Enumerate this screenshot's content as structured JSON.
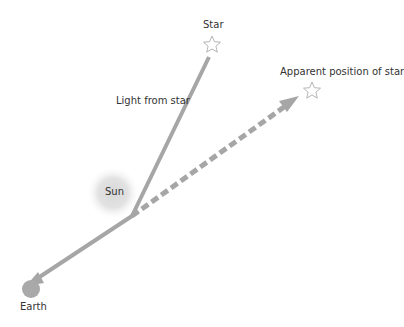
{
  "labels": {
    "star": "Star",
    "apparent": "Apparent position of star",
    "light": "Light from star",
    "sun": "Sun",
    "earth": "Earth"
  },
  "colors": {
    "ray": "#a6a6a6",
    "star_outline": "#b5b5b5",
    "sun_core": "#cfcfcf",
    "earth": "#a9a9a9",
    "text": "#333333"
  }
}
